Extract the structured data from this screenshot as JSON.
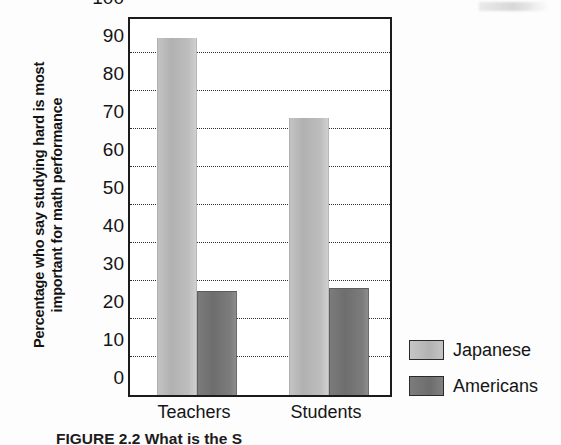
{
  "figure": {
    "ylabel_line1": "Percentage who say studying hard is most",
    "ylabel_line2": "important for math performance",
    "caption": "FIGURE 2.2  What is the S",
    "legend_title": ""
  },
  "chart_data": {
    "type": "bar",
    "title": "",
    "xlabel": "",
    "ylabel": "Percentage who say studying hard is most important for math performance",
    "categories": [
      "Teachers",
      "Students"
    ],
    "series": [
      {
        "name": "Japanese",
        "values": [
          94,
          73
        ],
        "color": "#b8b8b8"
      },
      {
        "name": "Americans",
        "values": [
          27,
          28
        ],
        "color": "#787878"
      }
    ],
    "ylim": [
      0,
      100
    ],
    "yticks": [
      0,
      10,
      20,
      30,
      40,
      50,
      60,
      70,
      80,
      90,
      100
    ],
    "ytick_labels": [
      "0",
      "10",
      "20",
      "30",
      "40",
      "50",
      "60",
      "70",
      "80",
      "90",
      "100"
    ],
    "grid": true,
    "grid_style": "dotted",
    "grid_axis": "y",
    "legend_position": "right",
    "orientation": "vertical",
    "grouped": true
  }
}
